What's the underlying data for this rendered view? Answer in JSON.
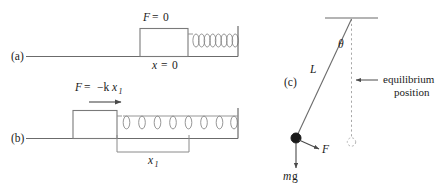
{
  "figure": {
    "background_color": "#ffffff",
    "stroke_color": "#555555",
    "text_color": "#1a1a1a",
    "width": 443,
    "height": 186
  },
  "panel_a": {
    "label": "(a)",
    "force_label_f": "F",
    "force_label_eq": "=",
    "force_label_value": "0",
    "position_label_x": "x",
    "position_label_eq": "=",
    "position_label_value": "0",
    "spring_coils": 8,
    "state": "relaxed"
  },
  "panel_b": {
    "label": "(b)",
    "force_label_f": "F",
    "force_label_eq": "=",
    "force_label_value": "−k",
    "force_label_var": "x",
    "force_label_sub": "1",
    "displacement_label": "x",
    "displacement_sub": "1",
    "spring_coils": 7,
    "state": "stretched",
    "arrow_direction": "right"
  },
  "panel_c": {
    "label": "(c)",
    "length_label": "L",
    "angle_label": "θ",
    "force_label": "F",
    "weight_label_m": "m",
    "weight_label_g": "g",
    "equilibrium_line1": "equilibrium",
    "equilibrium_line2": "position",
    "pivot": "ceiling-pivot",
    "bob": "pendulum-bob"
  }
}
